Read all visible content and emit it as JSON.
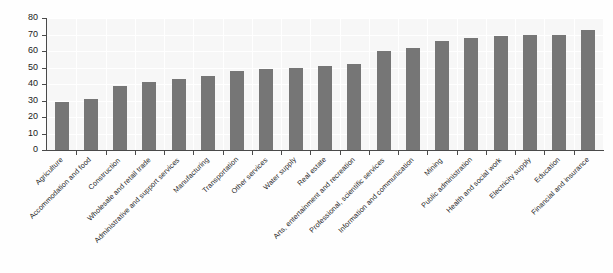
{
  "chart_data": {
    "type": "bar",
    "title": "",
    "subtitle": "",
    "xlabel": "",
    "ylabel": "",
    "ylim": [
      0,
      80
    ],
    "ytick_step": 10,
    "yticks": [
      0,
      10,
      20,
      30,
      40,
      50,
      60,
      70,
      80
    ],
    "grid": true,
    "legend": false,
    "legend_position": "none",
    "bar_color": "#767676",
    "plot_background": "#f7f7f7",
    "axis_color": "#4a4a4a",
    "label_rotation_degrees": -45,
    "categories": [
      "Agriculture",
      "Accommodation and food",
      "Construction",
      "Wholesale and retail trade",
      "Administrative and support services",
      "Manufacturing",
      "Transportation",
      "Other services",
      "Water supply",
      "Real estate",
      "Arts, entertainment and recreation",
      "Professional, scientific services",
      "Information and communication",
      "Mining",
      "Public administration",
      "Health and social work",
      "Electricity supply",
      "Education",
      "Financial and insurance"
    ],
    "values": [
      29,
      31,
      39,
      41,
      43,
      45,
      48,
      49,
      50,
      51,
      52,
      60,
      62,
      66,
      68,
      69,
      70,
      70,
      72.5
    ]
  }
}
